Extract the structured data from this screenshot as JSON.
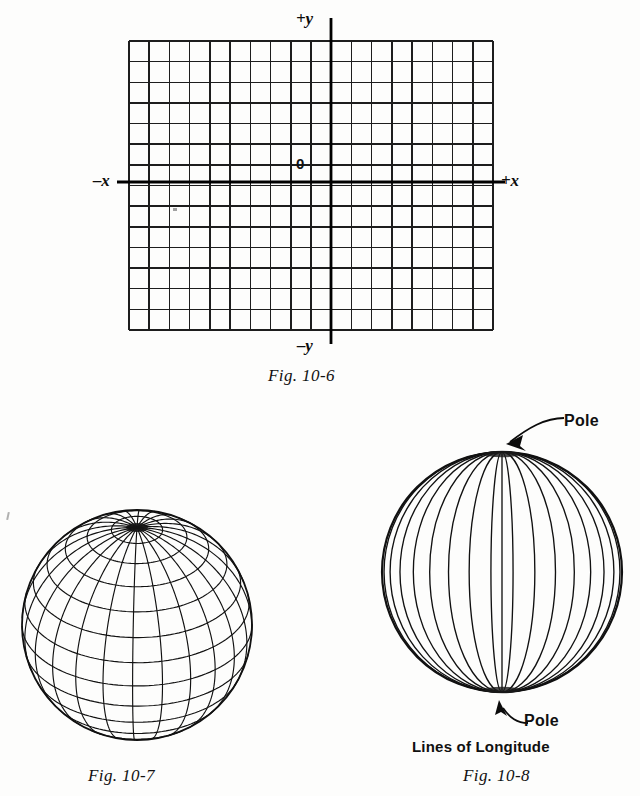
{
  "page": {
    "background_color": "#fdfdfc",
    "ink_color": "#111111",
    "width": 640,
    "height": 796
  },
  "figure_10_6": {
    "caption": "Fig. 10-6",
    "type": "cartesian-coordinate-grid",
    "axis_labels": {
      "negative_x": "–x",
      "positive_x": "+x",
      "positive_y": "+y",
      "negative_y": "–y",
      "origin": "0"
    },
    "grid": {
      "columns": 18,
      "rows": 14,
      "columns_left_of_y_axis": 10,
      "rows_above_x_axis": 9,
      "cell_width": 20.2,
      "cell_height": 20.6,
      "left": 129,
      "top": 41,
      "right": 493,
      "bottom": 330,
      "y_axis_x": 331,
      "x_axis_y": 182,
      "grid_line_color": "#1b1b1b",
      "axis_line_color": "#050505"
    }
  },
  "figure_10_7": {
    "caption": "Fig. 10-7",
    "type": "globe-wireframe-latitude-longitude",
    "description": "Sphere drawn with lines of latitude and longitude, pole tilted toward upper left",
    "center_x": 137,
    "center_y": 625,
    "radius": 115,
    "meridian_count": 24,
    "parallel_count": 14,
    "pole_tilt_degrees": 58
  },
  "figure_10_8": {
    "caption": "Fig. 10-8",
    "title": "Lines of Longitude",
    "type": "globe-wireframe-longitude",
    "description": "Sphere drawn with lines of longitude converging at the north and south poles",
    "center_x": 502,
    "center_y": 572,
    "radius": 120,
    "meridian_count": 17,
    "annotations": [
      {
        "label": "Pole",
        "target": "north-pole"
      },
      {
        "label": "Pole",
        "target": "south-pole"
      }
    ]
  }
}
